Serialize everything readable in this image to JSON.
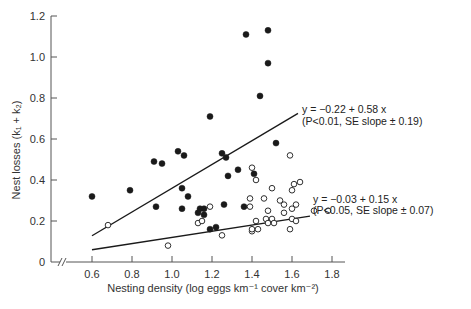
{
  "chart_data": {
    "type": "scatter",
    "title": "",
    "xlabel": "Nesting density (log eggs km⁻¹ cover km⁻²)",
    "ylabel": "Nest losses (k₁ + k₂)",
    "xlim": [
      0.45,
      1.85
    ],
    "ylim": [
      0,
      1.2
    ],
    "x_ticks": [
      "0.6",
      "0.8",
      "1.0",
      "1.2",
      "1.4",
      "1.6",
      "1.8"
    ],
    "y_ticks": [
      "0",
      "0.2",
      "0.4",
      "0.6",
      "0.8",
      "1.0",
      "1.2"
    ],
    "grid": false,
    "axis_break": "x-axis broken between 0 and 0.6",
    "series": [
      {
        "name": "filled circles",
        "marker": "filled",
        "points": [
          [
            0.6,
            0.32
          ],
          [
            0.79,
            0.35
          ],
          [
            0.91,
            0.49
          ],
          [
            0.95,
            0.48
          ],
          [
            0.92,
            0.27
          ],
          [
            1.03,
            0.54
          ],
          [
            1.06,
            0.52
          ],
          [
            1.05,
            0.36
          ],
          [
            1.08,
            0.32
          ],
          [
            1.05,
            0.26
          ],
          [
            1.13,
            0.24
          ],
          [
            1.14,
            0.26
          ],
          [
            1.16,
            0.26
          ],
          [
            1.16,
            0.23
          ],
          [
            1.19,
            0.16
          ],
          [
            1.22,
            0.17
          ],
          [
            1.19,
            0.71
          ],
          [
            1.25,
            0.53
          ],
          [
            1.27,
            0.51
          ],
          [
            1.28,
            0.42
          ],
          [
            1.33,
            0.45
          ],
          [
            1.26,
            0.28
          ],
          [
            1.36,
            0.27
          ],
          [
            1.41,
            0.43
          ],
          [
            1.37,
            1.11
          ],
          [
            1.48,
            1.13
          ],
          [
            1.48,
            0.97
          ],
          [
            1.44,
            0.81
          ],
          [
            1.52,
            0.58
          ]
        ],
        "regression": {
          "equation": "y  =  −0.22  +  0.58 x",
          "stats": "(P<0.01, SE slope ± 0.19)",
          "intercept": -0.22,
          "slope": 0.58,
          "x_range": [
            0.6,
            1.63
          ]
        }
      },
      {
        "name": "open circles",
        "marker": "open",
        "points": [
          [
            0.68,
            0.18
          ],
          [
            0.98,
            0.08
          ],
          [
            1.13,
            0.19
          ],
          [
            1.15,
            0.2
          ],
          [
            1.19,
            0.27
          ],
          [
            1.25,
            0.13
          ],
          [
            1.39,
            0.31
          ],
          [
            1.39,
            0.27
          ],
          [
            1.4,
            0.46
          ],
          [
            1.42,
            0.4
          ],
          [
            1.46,
            0.31
          ],
          [
            1.48,
            0.25
          ],
          [
            1.5,
            0.36
          ],
          [
            1.54,
            0.3
          ],
          [
            1.56,
            0.28
          ],
          [
            1.56,
            0.24
          ],
          [
            1.6,
            0.26
          ],
          [
            1.62,
            0.28
          ],
          [
            1.59,
            0.52
          ],
          [
            1.64,
            0.39
          ],
          [
            1.6,
            0.35
          ],
          [
            1.61,
            0.38
          ],
          [
            1.42,
            0.2
          ],
          [
            1.47,
            0.21
          ],
          [
            1.5,
            0.21
          ],
          [
            1.48,
            0.19
          ],
          [
            1.51,
            0.19
          ],
          [
            1.6,
            0.21
          ],
          [
            1.62,
            0.2
          ],
          [
            1.4,
            0.15
          ],
          [
            1.4,
            0.16
          ],
          [
            1.43,
            0.16
          ],
          [
            1.59,
            0.16
          ],
          [
            1.71,
            0.25
          ],
          [
            1.78,
            0.25
          ]
        ],
        "regression": {
          "equation": "y  =  −0.03  +  0.15 x",
          "stats": "(P<0.05, SE slope ± 0.07)",
          "intercept": -0.03,
          "slope": 0.15,
          "x_range": [
            0.6,
            1.69
          ]
        }
      }
    ]
  },
  "labels": {
    "ylabel": "Nest losses (k₁ + k₂)",
    "xlabel": "Nesting density (log eggs km⁻¹ cover km⁻²)",
    "upper_eq": "y  =  −0.22  +  0.58 x",
    "upper_stats": "(P<0.01, SE slope ± 0.19)",
    "lower_eq": "y  =  −0.03  +  0.15 x",
    "lower_stats": "(P<0.05, SE slope ± 0.07)"
  },
  "colors": {
    "ink": "#1a1a1a",
    "axis": "#555555",
    "background": "#ffffff"
  }
}
